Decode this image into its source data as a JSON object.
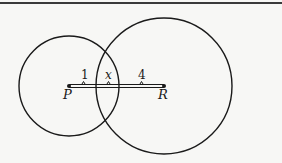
{
  "diagram": {
    "circles": [
      {
        "name": "circle-P",
        "center": "P",
        "cx": 69,
        "cy": 86,
        "r": 50
      },
      {
        "name": "circle-R",
        "center": "R",
        "cx": 164,
        "cy": 86,
        "r": 68
      }
    ],
    "points": [
      {
        "label": "P",
        "x": 69,
        "y": 86
      },
      {
        "label": "R",
        "x": 164,
        "y": 86
      }
    ],
    "segment_labels": {
      "first": "1",
      "middle": "x",
      "last": "4"
    },
    "colors": {
      "stroke": "#1a1a1a",
      "background": "#f7f7f5"
    }
  }
}
